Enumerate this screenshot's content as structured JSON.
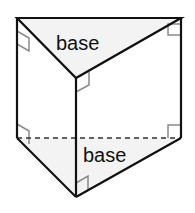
{
  "diagram": {
    "labels": {
      "top_base": "base",
      "bottom_base": "base"
    },
    "colors": {
      "edge": "#111111",
      "hidden_edge": "#333333",
      "base_fill": "#f3f3f3",
      "right_angle_marker": "#8a8a8a",
      "background": "#ffffff"
    }
  }
}
